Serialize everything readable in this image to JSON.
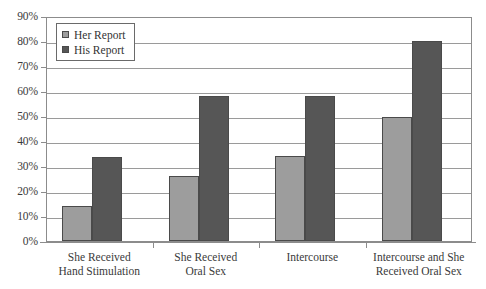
{
  "chart_data": {
    "type": "bar",
    "title": "",
    "subtitle": "",
    "xlabel": "",
    "ylabel": "",
    "grid": true,
    "legend_position": "top-left-inside",
    "ylim": [
      0,
      90
    ],
    "ytick_labels": [
      "90%",
      "80%",
      "70%",
      "60%",
      "50%",
      "40%",
      "30%",
      "20%",
      "10%",
      "0%"
    ],
    "ytick_values": [
      90,
      80,
      70,
      60,
      50,
      40,
      30,
      20,
      10,
      0
    ],
    "categories": [
      "She Received Hand Stimulation",
      "She Received Oral Sex",
      "Intercourse",
      "Intercourse and She Received Oral Sex"
    ],
    "category_lines": [
      [
        "She Received",
        "Hand Stimulation"
      ],
      [
        "She Received",
        "Oral Sex"
      ],
      [
        "Intercourse",
        ""
      ],
      [
        "Intercourse and She",
        "Received Oral Sex"
      ]
    ],
    "series": [
      {
        "name": "Her Report",
        "color": "#9d9d9d",
        "values": [
          14,
          26,
          34,
          49.5
        ]
      },
      {
        "name": "His Report",
        "color": "#565656",
        "values": [
          33.5,
          58,
          58,
          80
        ]
      }
    ]
  },
  "legend": {
    "items": [
      {
        "label": "Her Report",
        "swatch": "her"
      },
      {
        "label": "His Report",
        "swatch": "his"
      }
    ]
  }
}
